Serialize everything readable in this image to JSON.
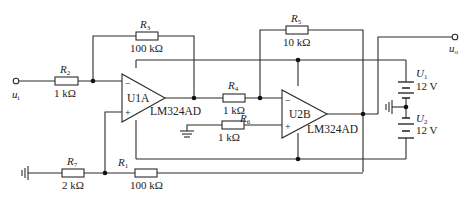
{
  "diagram": {
    "type": "circuit-schematic",
    "input_terminal": {
      "label": "u",
      "sub": "i"
    },
    "output_terminal": {
      "label": "u",
      "sub": "o"
    },
    "resistors": [
      {
        "id": "R2",
        "name": "R",
        "sub": "2",
        "value": "1 kΩ"
      },
      {
        "id": "R3",
        "name": "R",
        "sub": "3",
        "value": "100 kΩ"
      },
      {
        "id": "R4",
        "name": "R",
        "sub": "4",
        "value": "1 kΩ"
      },
      {
        "id": "R5",
        "name": "R",
        "sub": "5",
        "value": "10 kΩ"
      },
      {
        "id": "R6",
        "name": "R",
        "sub": "6",
        "value": "1 kΩ"
      },
      {
        "id": "R7",
        "name": "R",
        "sub": "7",
        "value": "2 kΩ"
      },
      {
        "id": "R1",
        "name": "R",
        "sub": "1",
        "value": "100 kΩ"
      }
    ],
    "opamps": [
      {
        "id": "U1A",
        "label": "U1A",
        "part": "LM324AD",
        "minus": "−",
        "plus": "+"
      },
      {
        "id": "U2B",
        "label": "U2B",
        "part": "LM324AD",
        "minus": "−",
        "plus": "+"
      }
    ],
    "sources": [
      {
        "id": "U1",
        "name": "U",
        "sub": "1",
        "value": "12 V"
      },
      {
        "id": "U2",
        "name": "U",
        "sub": "2",
        "value": "12 V"
      }
    ]
  }
}
